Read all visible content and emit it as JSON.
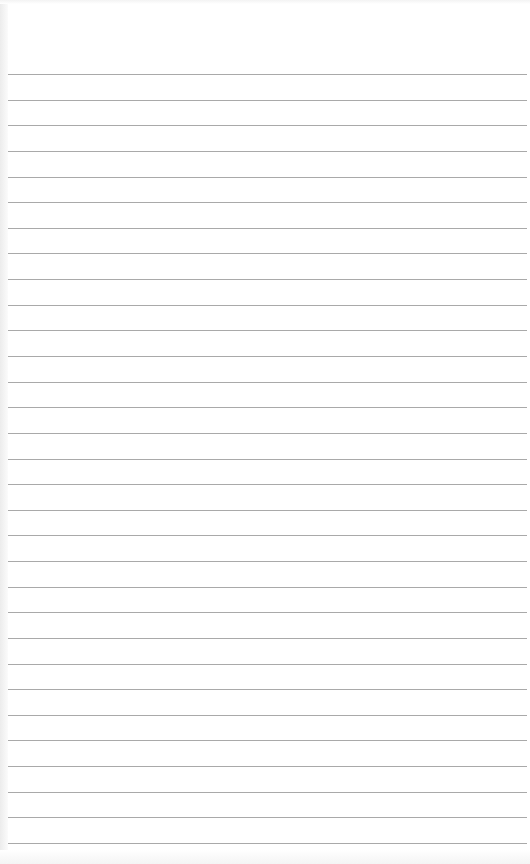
{
  "page": {
    "type": "lined-paper",
    "background_color": "#ffffff",
    "line_color": "#a9a9a9",
    "ruled_line_count": 31
  }
}
